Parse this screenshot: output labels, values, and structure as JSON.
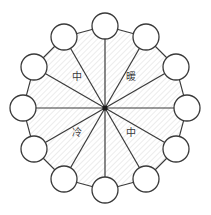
{
  "diagram": {
    "type": "radial-color-wheel",
    "geometry": {
      "center_x": 105,
      "center_y": 108,
      "ring_radius": 82,
      "node_radius": 13,
      "spoke_count": 12,
      "start_angle_deg": -90
    },
    "colors": {
      "stroke": "#3a3a3a",
      "node_fill": "#ffffff",
      "hub": "#1a1a1a",
      "hatch": "#dcdcdc",
      "background": "#ffffff",
      "label_text": "#3b3b3b"
    },
    "style": {
      "hatch_angle_deg": 45,
      "hatch_spacing": 4,
      "polygon_stroke_width": 1.1,
      "spoke_stroke_width": 1.2,
      "node_stroke_width": 1.3
    },
    "nodes": [
      {
        "index": 0,
        "angle_deg": -90,
        "cx": 105,
        "cy": 26,
        "label": ""
      },
      {
        "index": 1,
        "angle_deg": -60,
        "cx": 146,
        "cy": 37,
        "label": ""
      },
      {
        "index": 2,
        "angle_deg": -30,
        "cx": 176,
        "cy": 67,
        "label": ""
      },
      {
        "index": 3,
        "angle_deg": 0,
        "cx": 187,
        "cy": 108,
        "label": ""
      },
      {
        "index": 4,
        "angle_deg": 30,
        "cx": 176,
        "cy": 149,
        "label": ""
      },
      {
        "index": 5,
        "angle_deg": 60,
        "cx": 146,
        "cy": 179,
        "label": ""
      },
      {
        "index": 6,
        "angle_deg": 90,
        "cx": 105,
        "cy": 190,
        "label": ""
      },
      {
        "index": 7,
        "angle_deg": 120,
        "cx": 64,
        "cy": 179,
        "label": ""
      },
      {
        "index": 8,
        "angle_deg": 150,
        "cx": 34,
        "cy": 149,
        "label": ""
      },
      {
        "index": 9,
        "angle_deg": 180,
        "cx": 23,
        "cy": 108,
        "label": ""
      },
      {
        "index": 10,
        "angle_deg": 210,
        "cx": 34,
        "cy": 67,
        "label": ""
      },
      {
        "index": 11,
        "angle_deg": 240,
        "cx": 64,
        "cy": 37,
        "label": ""
      }
    ],
    "quadrant_labels": [
      {
        "name": "upper-left",
        "text": "中",
        "x": 71,
        "y": 72
      },
      {
        "name": "upper-right",
        "text": "暖",
        "x": 125,
        "y": 72
      },
      {
        "name": "lower-left",
        "text": "冷",
        "x": 71,
        "y": 128
      },
      {
        "name": "lower-right",
        "text": "中",
        "x": 125,
        "y": 128
      }
    ]
  }
}
